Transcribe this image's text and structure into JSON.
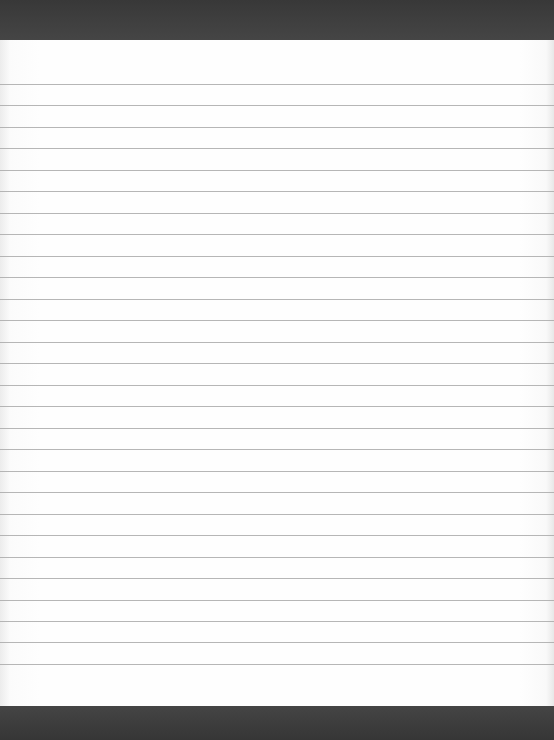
{
  "document": {
    "type": "lined-paper-scan",
    "caption": "Blank ruled sheet",
    "line_count": 28,
    "first_line_y": 84,
    "line_spacing": 21.48,
    "colors": {
      "background_dark": "#3c3c3c",
      "paper": "#fefefe",
      "rule_line": "#a9a9a9"
    }
  }
}
